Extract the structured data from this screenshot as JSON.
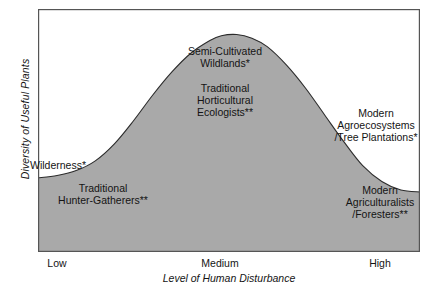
{
  "chart_data": {
    "type": "area",
    "title": "",
    "subtitle": "",
    "xlabel": "Level of Human Disturbance",
    "ylabel": "Diversity of Useful Plants",
    "x_tick_labels": [
      "Low",
      "Medium",
      "High"
    ],
    "x_tick_positions": [
      0.07,
      0.5,
      0.93
    ],
    "y_tick_labels": [],
    "grid": false,
    "legend": null,
    "xlim": [
      0,
      1
    ],
    "ylim": [
      0,
      1
    ],
    "fill_color": "#a9a9a9",
    "line_color": "#2b2b2b",
    "frame_color": "#4d4d4d",
    "background": "#ffffff",
    "series": [
      {
        "name": "Diversity of Useful Plants",
        "x": [
          0.0,
          0.05,
          0.1,
          0.15,
          0.2,
          0.25,
          0.3,
          0.35,
          0.4,
          0.45,
          0.48,
          0.52,
          0.56,
          0.6,
          0.65,
          0.7,
          0.75,
          0.8,
          0.85,
          0.9,
          0.95,
          1.0
        ],
        "y": [
          0.305,
          0.315,
          0.335,
          0.375,
          0.445,
          0.54,
          0.645,
          0.74,
          0.818,
          0.87,
          0.89,
          0.895,
          0.88,
          0.845,
          0.77,
          0.675,
          0.565,
          0.455,
          0.355,
          0.29,
          0.255,
          0.247
        ]
      }
    ],
    "annotations": [
      {
        "id": "semi-cultivated-wildlands",
        "text": "Semi-Cultivated\nWildlands*",
        "x": 0.47,
        "y": 0.93
      },
      {
        "id": "traditional-horticultural-ecologists",
        "text": "Traditional\nHorticultural\nEcologists**",
        "x": 0.5,
        "y": 0.8
      },
      {
        "id": "modern-agroecosystems",
        "text": "Modern\nAgroecosystems\n/Tree Plantations*",
        "x": 0.89,
        "y": 0.64
      },
      {
        "id": "wilderness",
        "text": "Wilderness*",
        "x": 0.1,
        "y": 0.4
      },
      {
        "id": "traditional-hunter-gatherers",
        "text": "Traditional\nHunter-Gatherers**",
        "x": 0.16,
        "y": 0.29
      },
      {
        "id": "modern-agriculturalists",
        "text": "Modern\nAgriculturalists\n/Foresters**",
        "x": 0.89,
        "y": 0.25
      }
    ]
  },
  "axis": {
    "y_title": "Diversity of Useful Plants",
    "x_title": "Level of Human Disturbance",
    "ticks": {
      "low": "Low",
      "medium": "Medium",
      "high": "High"
    }
  },
  "labels": {
    "semi_cultivated_wildlands": "Semi-Cultivated\nWildlands*",
    "traditional_horticultural_ecologists": "Traditional\nHorticultural\nEcologists**",
    "modern_agroecosystems": "Modern\nAgroecosystems\n/Tree Plantations*",
    "wilderness": "Wilderness*",
    "traditional_hunter_gatherers": "Traditional\nHunter-Gatherers**",
    "modern_agriculturalists": "Modern\nAgriculturalists\n/Foresters**"
  }
}
